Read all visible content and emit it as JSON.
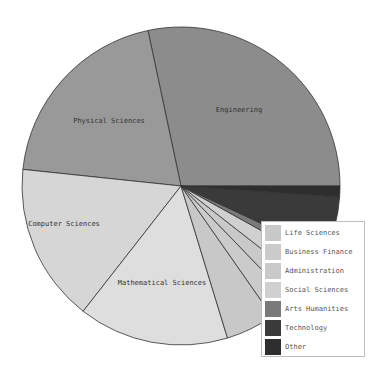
{
  "chart_data": {
    "type": "pie",
    "title": "",
    "start_angle_deg": 0,
    "direction": "clockwise_from_east",
    "slices": [
      {
        "label": "Engineering",
        "value": 28.3,
        "start": 258,
        "end": 360,
        "color": "#8c8c8c",
        "show_label": true
      },
      {
        "label": "Physical Sciences",
        "value": 20.0,
        "start": 186,
        "end": 258,
        "color": "#999999",
        "show_label": true
      },
      {
        "label": "Computer Sciences",
        "value": 16.1,
        "start": 128,
        "end": 186,
        "color": "#d6d6d6",
        "show_label": true
      },
      {
        "label": "Mathematical Sciences",
        "value": 15.3,
        "start": 73,
        "end": 128,
        "color": "#dedede",
        "show_label": true
      },
      {
        "label": "Life Sciences",
        "value": 5.0,
        "start": 55,
        "end": 73,
        "color": "#c8c8c8",
        "show_label": false
      },
      {
        "label": "Business Finance",
        "value": 2.5,
        "start": 46,
        "end": 55,
        "color": "#cbcbcb",
        "show_label": false
      },
      {
        "label": "Administration",
        "value": 2.2,
        "start": 38,
        "end": 46,
        "color": "#c9c9c9",
        "show_label": false
      },
      {
        "label": "Social Sciences",
        "value": 2.5,
        "start": 29,
        "end": 38,
        "color": "#d0d0d0",
        "show_label": false
      },
      {
        "label": "Arts Humanities",
        "value": 1.1,
        "start": 25,
        "end": 29,
        "color": "#7a7a7a",
        "show_label": false
      },
      {
        "label": "Technology",
        "value": 5.8,
        "start": 4,
        "end": 25,
        "color": "#3a3a3a",
        "show_label": false
      },
      {
        "label": "Other",
        "value": 1.1,
        "start": 0,
        "end": 4,
        "color": "#2e2e2e",
        "show_label": false
      }
    ],
    "legend": {
      "position": "lower right",
      "entries": [
        "Life Sciences",
        "Business Finance",
        "Administration",
        "Social Sciences",
        "Arts Humanities",
        "Technology",
        "Other"
      ]
    }
  },
  "labels": {
    "engineering": "Engineering",
    "physical": "Physical Sciences",
    "computer": "Computer Sciences",
    "math": "Mathematical Sciences"
  },
  "legend": {
    "items": [
      {
        "label": "Life Sciences",
        "color": "#c8c8c8"
      },
      {
        "label": "Business Finance",
        "color": "#cbcbcb"
      },
      {
        "label": "Administration",
        "color": "#c9c9c9"
      },
      {
        "label": "Social Sciences",
        "color": "#d0d0d0"
      },
      {
        "label": "Arts Humanities",
        "color": "#7a7a7a"
      },
      {
        "label": "Technology",
        "color": "#3a3a3a"
      },
      {
        "label": "Other",
        "color": "#2e2e2e"
      }
    ]
  }
}
